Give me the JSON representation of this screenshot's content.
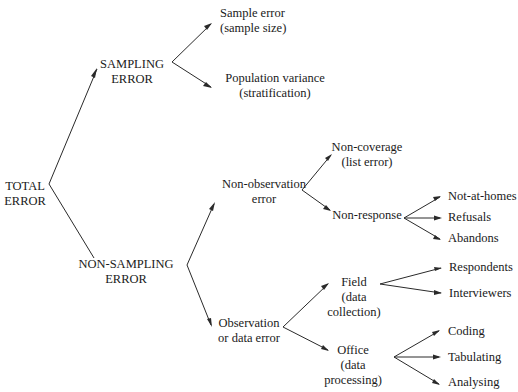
{
  "diagram": {
    "type": "tree",
    "line_color": "#2a2a2a",
    "text_color": "#1a1a1a",
    "root": {
      "line1": "TOTAL",
      "line2": "ERROR"
    },
    "sampling": {
      "line1": "SAMPLING",
      "line2": "ERROR",
      "children": {
        "sample_error": {
          "line1": "Sample error",
          "line2": "(sample size)"
        },
        "population_variance": {
          "line1": "Population variance",
          "line2": "(stratification)"
        }
      }
    },
    "non_sampling": {
      "line1": "NON-SAMPLING",
      "line2": "ERROR",
      "non_observation": {
        "line1": "Non-observation",
        "line2": "error",
        "non_coverage": {
          "line1": "Non-coverage",
          "line2": "(list error)"
        },
        "non_response": {
          "label": "Non-response",
          "children": [
            "Not-at-homes",
            "Refusals",
            "Abandons"
          ]
        }
      },
      "observation": {
        "line1": "Observation",
        "line2": "or data error",
        "field": {
          "line1": "Field",
          "line2": "(data",
          "line3": "collection)",
          "children": [
            "Respondents",
            "Interviewers"
          ]
        },
        "office": {
          "line1": "Office",
          "line2": "(data",
          "line3": "processing)",
          "children": [
            "Coding",
            "Tabulating",
            "Analysing"
          ]
        }
      }
    }
  }
}
